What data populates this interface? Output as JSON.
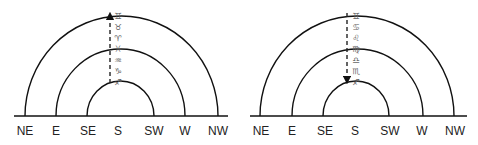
{
  "colors": {
    "line": "#111111",
    "zodiac_symbol": "#666666",
    "background": "#ffffff"
  },
  "diagrams": [
    {
      "name": "left",
      "arrow_direction": "up",
      "directions": [
        "NE",
        "E",
        "SE",
        "S",
        "SW",
        "W",
        "NW"
      ],
      "zodiac": [
        "♊",
        "♉",
        "♈",
        "♓",
        "♒",
        "♑",
        "♐"
      ],
      "zodiac_names": [
        "Gemini",
        "Taurus",
        "Aries",
        "Pisces",
        "Aquarius",
        "Capricorn",
        "Sagittarius"
      ]
    },
    {
      "name": "right",
      "arrow_direction": "down",
      "directions": [
        "NE",
        "E",
        "SE",
        "S",
        "SW",
        "W",
        "NW"
      ],
      "zodiac": [
        "♊",
        "♋",
        "♌",
        "♍",
        "♎",
        "♏",
        "♐"
      ],
      "zodiac_names": [
        "Gemini",
        "Cancer",
        "Leo",
        "Virgo",
        "Libra",
        "Scorpio",
        "Sagittarius"
      ]
    }
  ]
}
